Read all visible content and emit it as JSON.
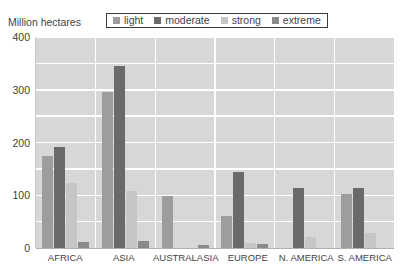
{
  "chart_data": {
    "type": "bar",
    "title": "",
    "subtitle": "",
    "xlabel": "",
    "ylabel": "Million hectares",
    "ylim": [
      0,
      400
    ],
    "yticks": [
      0,
      100,
      200,
      300,
      400
    ],
    "grid": true,
    "legend_position": "top",
    "categories": [
      "AFRICA",
      "ASIA",
      "AUSTRALASIA",
      "EUROPE",
      "N. AMERICA",
      "S. AMERICA"
    ],
    "series": [
      {
        "name": "light",
        "color": "#9d9d9d",
        "values": [
          175,
          295,
          98,
          61,
          0,
          102
        ]
      },
      {
        "name": "moderate",
        "color": "#6a6a6a",
        "values": [
          192,
          345,
          0,
          145,
          113,
          113
        ]
      },
      {
        "name": "strong",
        "color": "#c6c6c6",
        "values": [
          123,
          108,
          0,
          10,
          20,
          29
        ]
      },
      {
        "name": "extreme",
        "color": "#8a8a8a",
        "values": [
          12,
          13,
          6,
          8,
          0,
          0
        ]
      }
    ]
  },
  "axis": {
    "y_title": "Million hectares",
    "y_tick_labels": [
      "400",
      "300",
      "200",
      "100",
      "0"
    ]
  },
  "legend": {
    "items": [
      {
        "label": "light",
        "color": "#9d9d9d"
      },
      {
        "label": "moderate",
        "color": "#6a6a6a"
      },
      {
        "label": "strong",
        "color": "#c6c6c6"
      },
      {
        "label": "extreme",
        "color": "#8a8a8a"
      }
    ]
  },
  "colors": {
    "plot_background": "#d7d7d7",
    "gridline": "#ffffff",
    "text": "#3f3f3f",
    "legend_border": "#3d3d3d"
  }
}
